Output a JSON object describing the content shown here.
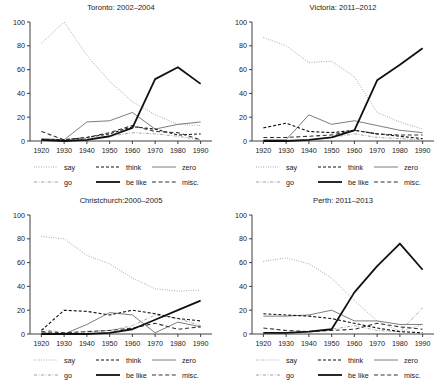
{
  "figure": {
    "name": "quotative-verbs-apparent-time-panels",
    "panel_count": 4,
    "colors": {
      "ink": "#1a1a1a",
      "axis": "#2b2b2b",
      "dark": "#111111",
      "mid": "#555555",
      "light": "#8a8a8a",
      "background": "#ffffff"
    }
  },
  "legend": {
    "entries": [
      {
        "label": "say",
        "style": "dotted",
        "dash": "0.8 1.6",
        "width": 0.9,
        "color": "#8a8a8a"
      },
      {
        "label": "think",
        "style": "dashed",
        "dash": "3 2",
        "width": 1.1,
        "color": "#111111"
      },
      {
        "label": "zero",
        "style": "solid",
        "dash": "none",
        "width": 0.9,
        "color": "#6e6e6e"
      },
      {
        "label": "go",
        "style": "dashdot",
        "dash": "3 1.6 0.8 1.6",
        "width": 0.9,
        "color": "#9a9a9a"
      },
      {
        "label": "be like",
        "style": "solid",
        "dash": "none",
        "width": 1.8,
        "color": "#111111"
      },
      {
        "label": "misc.",
        "style": "longdash",
        "dash": "4 2.6",
        "width": 1.1,
        "color": "#333333"
      }
    ]
  },
  "chart_data": [
    {
      "type": "line",
      "title": "Toronto: 2002–2004",
      "xlabel": "",
      "ylabel": "",
      "x": [
        1920,
        1930,
        1940,
        1950,
        1960,
        1970,
        1980,
        1990
      ],
      "xticklabels": [
        "1920",
        "1930",
        "1940",
        "1950",
        "1960",
        "1970",
        "1980",
        "1990"
      ],
      "xlim": [
        1915,
        1995
      ],
      "ylim": [
        0,
        100
      ],
      "yticks": [
        0,
        20,
        40,
        60,
        80,
        100
      ],
      "yticklabels": [
        "0",
        "20",
        "40",
        "60",
        "80",
        "100"
      ],
      "grid": false,
      "legend_position": "below",
      "series": [
        {
          "name": "say",
          "values": [
            82,
            100,
            72,
            50,
            33,
            22,
            14,
            13
          ]
        },
        {
          "name": "think",
          "values": [
            1,
            1,
            3,
            6,
            12,
            10,
            5,
            6
          ]
        },
        {
          "name": "zero",
          "values": [
            2,
            1,
            16,
            17,
            24,
            10,
            14,
            16
          ]
        },
        {
          "name": "go",
          "values": [
            1,
            0,
            2,
            4,
            7,
            6,
            4,
            1
          ]
        },
        {
          "name": "be like",
          "values": [
            1,
            0,
            1,
            4,
            11,
            52,
            62,
            48
          ]
        },
        {
          "name": "misc.",
          "values": [
            8,
            1,
            3,
            7,
            13,
            8,
            7,
            1
          ]
        }
      ]
    },
    {
      "type": "line",
      "title": "Victoria: 2011–2012",
      "xlabel": "",
      "ylabel": "",
      "x": [
        1920,
        1930,
        1940,
        1950,
        1960,
        1970,
        1980,
        1990
      ],
      "xticklabels": [
        "1920",
        "1930",
        "1940",
        "1950",
        "1960",
        "1970",
        "1980",
        "1990"
      ],
      "xlim": [
        1915,
        1995
      ],
      "ylim": [
        0,
        100
      ],
      "yticks": [
        0,
        20,
        40,
        60,
        80,
        100
      ],
      "yticklabels": [
        "0",
        "20",
        "40",
        "60",
        "80",
        "100"
      ],
      "grid": false,
      "legend_position": "below",
      "series": [
        {
          "name": "say",
          "values": [
            87,
            80,
            66,
            67,
            54,
            24,
            16,
            10
          ]
        },
        {
          "name": "think",
          "values": [
            11,
            15,
            8,
            7,
            9,
            6,
            4,
            2
          ]
        },
        {
          "name": "zero",
          "values": [
            1,
            1,
            22,
            14,
            17,
            13,
            9,
            7
          ]
        },
        {
          "name": "go",
          "values": [
            0,
            0,
            1,
            3,
            6,
            3,
            2,
            1
          ]
        },
        {
          "name": "be like",
          "values": [
            0,
            0,
            1,
            3,
            9,
            51,
            64,
            78
          ]
        },
        {
          "name": "misc.",
          "values": [
            3,
            3,
            4,
            5,
            9,
            6,
            5,
            5
          ]
        }
      ]
    },
    {
      "type": "line",
      "title": "Christchurch:2000–2005",
      "xlabel": "",
      "ylabel": "",
      "x": [
        1920,
        1930,
        1940,
        1950,
        1960,
        1970,
        1980,
        1990
      ],
      "xticklabels": [
        "1920",
        "1930",
        "1940",
        "1950",
        "1960",
        "1970",
        "1980",
        "1990"
      ],
      "xlim": [
        1915,
        1995
      ],
      "ylim": [
        0,
        100
      ],
      "yticks": [
        0,
        20,
        40,
        60,
        80,
        100
      ],
      "yticklabels": [
        "0",
        "20",
        "40",
        "60",
        "80",
        "100"
      ],
      "grid": false,
      "legend_position": "below",
      "series": [
        {
          "name": "say",
          "values": [
            82,
            80,
            66,
            59,
            47,
            38,
            36,
            37
          ]
        },
        {
          "name": "think",
          "values": [
            3,
            20,
            19,
            16,
            20,
            17,
            13,
            11
          ]
        },
        {
          "name": "zero",
          "values": [
            1,
            0,
            8,
            18,
            16,
            1,
            10,
            6
          ]
        },
        {
          "name": "go",
          "values": [
            4,
            1,
            2,
            3,
            7,
            16,
            13,
            7
          ]
        },
        {
          "name": "be like",
          "values": [
            0,
            0,
            0,
            1,
            4,
            12,
            20,
            28
          ]
        },
        {
          "name": "misc.",
          "values": [
            2,
            1,
            2,
            3,
            5,
            9,
            4,
            6
          ]
        }
      ]
    },
    {
      "type": "line",
      "title": "Perth: 2011–2013",
      "xlabel": "",
      "ylabel": "",
      "x": [
        1920,
        1930,
        1940,
        1950,
        1960,
        1970,
        1980,
        1990
      ],
      "xticklabels": [
        "1920",
        "1930",
        "1940",
        "1950",
        "1960",
        "1970",
        "1980",
        "1990"
      ],
      "xlim": [
        1915,
        1995
      ],
      "ylim": [
        0,
        100
      ],
      "yticks": [
        0,
        20,
        40,
        60,
        80,
        100
      ],
      "yticklabels": [
        "0",
        "20",
        "40",
        "60",
        "80",
        "100"
      ],
      "grid": false,
      "legend_position": "below",
      "series": [
        {
          "name": "say",
          "values": [
            61,
            64,
            59,
            47,
            28,
            11,
            2,
            8
          ]
        },
        {
          "name": "think",
          "values": [
            17,
            16,
            15,
            13,
            9,
            5,
            2,
            1
          ]
        },
        {
          "name": "zero",
          "values": [
            15,
            15,
            16,
            20,
            11,
            11,
            8,
            8
          ]
        },
        {
          "name": "go",
          "values": [
            1,
            1,
            2,
            4,
            7,
            3,
            2,
            22
          ]
        },
        {
          "name": "be like",
          "values": [
            1,
            1,
            2,
            4,
            35,
            57,
            76,
            54
          ]
        },
        {
          "name": "misc.",
          "values": [
            5,
            3,
            2,
            3,
            4,
            9,
            6,
            4
          ]
        }
      ]
    }
  ]
}
